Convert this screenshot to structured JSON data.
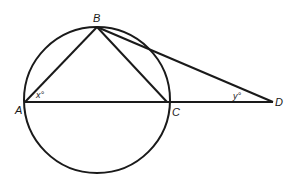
{
  "figure": {
    "points": {
      "A": {
        "label": "A"
      },
      "B": {
        "label": "B"
      },
      "C": {
        "label": "C"
      },
      "D": {
        "label": "D"
      }
    },
    "angles": {
      "x": {
        "label": "x°",
        "at": "A"
      },
      "y": {
        "label": "y°",
        "at": "D"
      }
    },
    "segments": [
      "AB",
      "BC",
      "AC",
      "CD",
      "BD"
    ],
    "circle": "circle through A, B, C",
    "stroke_color": "#1a1a1a"
  }
}
